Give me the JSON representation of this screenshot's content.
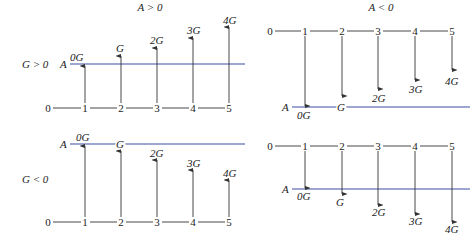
{
  "figure": {
    "column_headers": [
      "A > 0",
      "A < 0"
    ],
    "row_headers": [
      "G > 0",
      "G < 0"
    ],
    "axis_labels": [
      "0",
      "1",
      "2",
      "3",
      "4",
      "5"
    ],
    "arrow_labels": [
      "0G",
      "G",
      "2G",
      "3G",
      "4G"
    ],
    "reference_line_label": "A",
    "colors": {
      "reference_line": "#3a4fa3",
      "arrows": "#333333"
    }
  },
  "panels": [
    {
      "id": "top-left",
      "condition_A": "A > 0",
      "condition_G": "G > 0",
      "direction": "up",
      "baseline_y": 108,
      "aline_y": 64,
      "aline_x": [
        70,
        245
      ],
      "xs": [
        48,
        85,
        121,
        157,
        193,
        229
      ],
      "arrow_tips": [
        66,
        56,
        48,
        38,
        27
      ],
      "label_pos": [
        [
          70,
          61
        ],
        [
          116,
          52
        ],
        [
          150,
          44
        ],
        [
          187,
          34
        ],
        [
          223,
          24
        ]
      ]
    },
    {
      "id": "top-right",
      "condition_A": "A < 0",
      "condition_G": "G > 0",
      "direction": "down",
      "baseline_y": 31,
      "aline_y": 107,
      "aline_x": [
        292,
        470
      ],
      "xs": [
        270,
        305,
        342,
        378,
        415,
        452
      ],
      "arrow_tips": [
        106,
        96,
        89,
        80,
        70
      ],
      "label_pos": [
        [
          297,
          119
        ],
        [
          337,
          111
        ],
        [
          372,
          102
        ],
        [
          409,
          93
        ],
        [
          445,
          85
        ]
      ]
    },
    {
      "id": "bottom-left",
      "condition_A": "A > 0",
      "condition_G": "G < 0",
      "direction": "up",
      "baseline_y": 222,
      "aline_y": 144,
      "aline_x": [
        70,
        245
      ],
      "xs": [
        48,
        85,
        121,
        157,
        193,
        229
      ],
      "arrow_tips": [
        146,
        151,
        160,
        170,
        180
      ],
      "label_pos": [
        [
          76,
          141
        ],
        [
          116,
          148
        ],
        [
          150,
          157
        ],
        [
          187,
          167
        ],
        [
          223,
          177
        ]
      ]
    },
    {
      "id": "bottom-right",
      "condition_A": "A < 0",
      "condition_G": "G < 0",
      "direction": "down",
      "baseline_y": 146,
      "aline_y": 189,
      "aline_x": [
        292,
        470
      ],
      "xs": [
        270,
        305,
        342,
        378,
        415,
        452
      ],
      "arrow_tips": [
        188,
        194,
        205,
        214,
        222
      ],
      "label_pos": [
        [
          297,
          200
        ],
        [
          336,
          206
        ],
        [
          372,
          216
        ],
        [
          409,
          225
        ],
        [
          445,
          233
        ]
      ]
    }
  ]
}
